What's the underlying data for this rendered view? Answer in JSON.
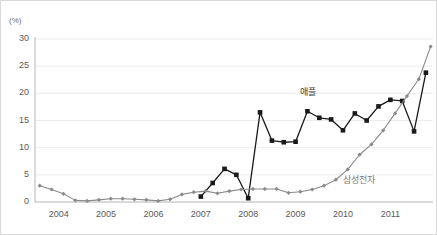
{
  "chart_data": {
    "type": "line",
    "title": "",
    "subtitle": "",
    "xlabel": "",
    "ylabel": "(%)",
    "yunit": "(%)",
    "ylim": [
      0,
      30
    ],
    "yticks": [
      0,
      5,
      10,
      15,
      20,
      25,
      30
    ],
    "ytick_labels": [
      "0",
      "5",
      "10",
      "15",
      "20",
      "25",
      "30"
    ],
    "xlim": [
      2003.5,
      2011.9
    ],
    "xticks": [
      2004,
      2005,
      2006,
      2007,
      2008,
      2009,
      2010,
      2011
    ],
    "xtick_labels": [
      "2004",
      "2005",
      "2006",
      "2007",
      "2008",
      "2009",
      "2010",
      "2011"
    ],
    "grid": "horizontal",
    "legend_position": "inline-annotation",
    "series": [
      {
        "name": "애플",
        "label": "애플",
        "color": "#1a1a1a",
        "marker": "square",
        "x": [
          2007.0,
          2007.25,
          2007.5,
          2007.75,
          2008.0,
          2008.25,
          2008.5,
          2008.75,
          2009.0,
          2009.25,
          2009.5,
          2009.75,
          2010.0,
          2010.25,
          2010.5,
          2010.75,
          2011.0,
          2011.25,
          2011.5,
          2011.75
        ],
        "values": [
          1.0,
          3.5,
          6.1,
          5.0,
          0.7,
          16.5,
          11.3,
          11.0,
          11.1,
          16.7,
          15.5,
          15.2,
          13.2,
          16.3,
          15.0,
          17.6,
          18.8,
          18.6,
          13.0,
          23.8
        ],
        "label_x": 2009.1,
        "label_y": 20.5
      },
      {
        "name": "삼성전자",
        "label": "삼성전자",
        "color": "#8a8a8a",
        "marker": "diamond",
        "x": [
          2003.6,
          2003.85,
          2004.1,
          2004.35,
          2004.6,
          2004.85,
          2005.1,
          2005.35,
          2005.6,
          2005.85,
          2006.1,
          2006.35,
          2006.6,
          2006.85,
          2007.1,
          2007.35,
          2007.6,
          2007.85,
          2008.1,
          2008.35,
          2008.6,
          2008.85,
          2009.1,
          2009.35,
          2009.6,
          2009.85,
          2010.1,
          2010.35,
          2010.6,
          2010.85,
          2011.1,
          2011.35,
          2011.6,
          2011.85
        ],
        "values": [
          3.0,
          2.3,
          1.5,
          0.3,
          0.2,
          0.4,
          0.6,
          0.6,
          0.5,
          0.4,
          0.2,
          0.5,
          1.4,
          1.8,
          2.0,
          1.6,
          2.0,
          2.3,
          2.4,
          2.4,
          2.4,
          1.7,
          1.9,
          2.3,
          3.0,
          4.1,
          6.0,
          8.7,
          10.6,
          13.2,
          16.3,
          19.5,
          22.6,
          28.6
        ],
        "label_x": 2010.0,
        "label_y": 4.2
      }
    ]
  }
}
